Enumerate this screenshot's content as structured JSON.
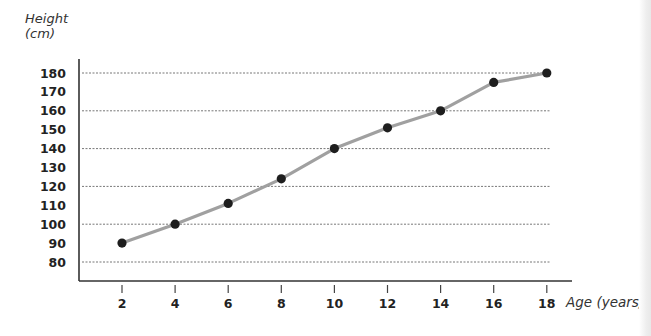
{
  "chart_data": {
    "type": "line",
    "title": "",
    "xlabel": "Age (years)",
    "ylabel_line1": "Height",
    "ylabel_line2": "(cm)",
    "x": [
      2,
      4,
      6,
      8,
      10,
      12,
      14,
      16,
      18
    ],
    "series": [
      {
        "name": "Height",
        "values": [
          90,
          100,
          111,
          124,
          140,
          151,
          160,
          175,
          180
        ]
      }
    ],
    "x_ticks": [
      2,
      4,
      6,
      8,
      10,
      12,
      14,
      16,
      18
    ],
    "y_ticks": [
      80,
      90,
      100,
      110,
      120,
      130,
      140,
      150,
      160,
      170,
      180
    ],
    "gridlines_y": [
      80,
      100,
      120,
      140,
      160,
      180
    ],
    "grid": "dashed horizontal",
    "xlim": [
      0,
      19
    ],
    "ylim": [
      73,
      184
    ],
    "legend": "none",
    "colors": {
      "line": "#a0a0a0",
      "marker": "#1e1e1e",
      "axis": "#333333",
      "grid": "#777777"
    }
  }
}
